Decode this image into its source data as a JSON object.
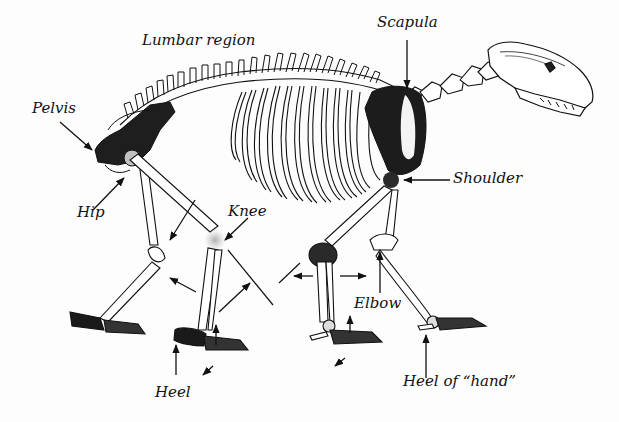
{
  "diagram": {
    "colors": {
      "ink": "#111111",
      "shade": "#1e1e1e",
      "joint_highlight": "#b8b8b8",
      "background": "#fdfdfd"
    },
    "labels": [
      {
        "id": "lumbar",
        "text": "Lumbar region",
        "x": 142,
        "y": 33
      },
      {
        "id": "scapula",
        "text": "Scapula",
        "x": 377,
        "y": 15
      },
      {
        "id": "pelvis",
        "text": "Pelvis",
        "x": 32,
        "y": 101
      },
      {
        "id": "shoulder",
        "text": "Shoulder",
        "x": 453,
        "y": 171
      },
      {
        "id": "hip",
        "text": "Hip",
        "x": 77,
        "y": 205
      },
      {
        "id": "knee",
        "text": "Knee",
        "x": 228,
        "y": 204
      },
      {
        "id": "elbow",
        "text": "Elbow",
        "x": 354,
        "y": 296
      },
      {
        "id": "heel",
        "text": "Heel",
        "x": 155,
        "y": 385
      },
      {
        "id": "heel_hand",
        "text": "Heel of “hand”",
        "x": 403,
        "y": 374
      }
    ]
  }
}
